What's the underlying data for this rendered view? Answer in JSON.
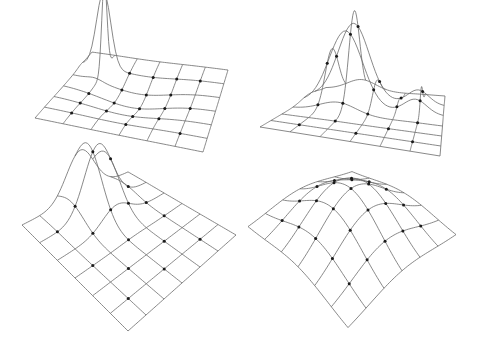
{
  "figure": {
    "line_color": "#6b6b6b",
    "node_color": "#1a1a1a",
    "background": "#ffffff"
  },
  "chart_data": [
    {
      "type": "surface-wireframe",
      "name": "panel-top-left",
      "grid_cells": 6,
      "surface": "sharp spike near back-left corner with a shallow trough around it",
      "peaks": [
        {
          "u": 0.15,
          "v": 0.2,
          "height": 1.0,
          "width": 0.05
        },
        {
          "u": 0.45,
          "v": 0.45,
          "height": -0.12,
          "width": 0.2
        }
      ]
    },
    {
      "type": "surface-wireframe",
      "name": "panel-top-right",
      "grid_cells": 6,
      "surface": "tall Gaussian peak near back-left with a smaller secondary bump to the right",
      "peaks": [
        {
          "u": 0.3,
          "v": 0.25,
          "height": 1.0,
          "width": 0.12
        },
        {
          "u": 0.8,
          "v": 0.25,
          "height": 0.25,
          "width": 0.08
        }
      ]
    },
    {
      "type": "surface-wireframe",
      "name": "panel-bottom-left",
      "grid_cells": 6,
      "surface": "Gaussian ridge peaking near the back-right edge",
      "peaks": [
        {
          "u": 0.55,
          "v": 0.12,
          "height": 1.0,
          "width": 0.13
        }
      ]
    },
    {
      "type": "surface-wireframe",
      "name": "panel-bottom-right",
      "grid_cells": 6,
      "surface": "broad central dome",
      "peaks": [
        {
          "u": 0.5,
          "v": 0.5,
          "height": 1.0,
          "width": 0.3
        }
      ]
    }
  ]
}
